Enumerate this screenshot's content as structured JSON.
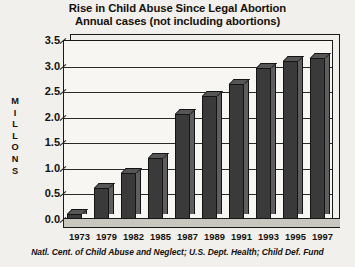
{
  "chart_data": {
    "type": "bar",
    "title": "Rise in Child Abuse Since Legal Abortion",
    "subtitle": "Annual cases (not including abortions)",
    "xlabel": "",
    "ylabel": "MILLIONS",
    "ylabel_letters": [
      "M",
      "I",
      "L",
      "L",
      "O",
      "N",
      "S"
    ],
    "categories": [
      "1973",
      "1979",
      "1982",
      "1985",
      "1987",
      "1989",
      "1991",
      "1993",
      "1995",
      "1997"
    ],
    "values": [
      0.1,
      0.6,
      0.9,
      1.2,
      2.05,
      2.4,
      2.65,
      2.95,
      3.1,
      3.15
    ],
    "ylim": [
      0.0,
      3.5
    ],
    "yticks": [
      "3.5",
      "3.0",
      "2.5",
      "2.0",
      "1.5",
      "1.0",
      "0.5",
      "0.0"
    ],
    "ytick_values": [
      3.5,
      3.0,
      2.5,
      2.0,
      1.5,
      1.0,
      0.5,
      0.0
    ],
    "grid": true,
    "legend": false,
    "source": "Natl. Cent. of Child Abuse and Neglect; U.S. Dept. Health; Child Def. Fund",
    "style": "3d-bar",
    "colors": {
      "background": "#f2f0ec",
      "plot_background": "#f7f6f3",
      "bar_front": "#3a3a3a",
      "bar_side": "#5e5e5e",
      "bar_top": "#565656",
      "axis": "#1a1a1a",
      "grid": "#2a2a2a",
      "floor": "#c9c6c0",
      "text": "#15110d"
    }
  }
}
